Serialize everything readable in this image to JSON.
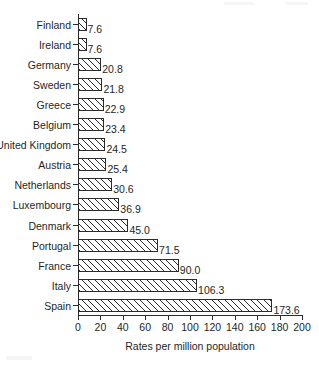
{
  "chart_data": {
    "type": "bar",
    "orientation": "horizontal",
    "title": "",
    "xlabel": "Rates per million population",
    "ylabel": "",
    "xlim": [
      0,
      200
    ],
    "xticks": [
      0,
      20,
      40,
      60,
      80,
      100,
      120,
      140,
      160,
      180,
      200
    ],
    "grid": false,
    "legend": null,
    "categories": [
      "Finland",
      "Ireland",
      "Germany",
      "Sweden",
      "Greece",
      "Belgium",
      "United Kingdom",
      "Austria",
      "Netherlands",
      "Luxembourg",
      "Denmark",
      "Portugal",
      "France",
      "Italy",
      "Spain"
    ],
    "values": [
      7.6,
      7.6,
      20.8,
      21.8,
      22.9,
      23.4,
      24.5,
      25.4,
      30.6,
      36.9,
      45.0,
      71.5,
      90.0,
      106.3,
      173.6
    ],
    "value_labels": [
      "7.6",
      "7.6",
      "20.8",
      "21.8",
      "22.9",
      "23.4",
      "24.5",
      "25.4",
      "30.6",
      "36.9",
      "45.0",
      "71.5",
      "90.0",
      "106.3",
      "173.6"
    ],
    "bar_style": {
      "fill": "#ffffff",
      "edge": "#2b2b2b",
      "hatch": "diagonal-forward"
    }
  }
}
